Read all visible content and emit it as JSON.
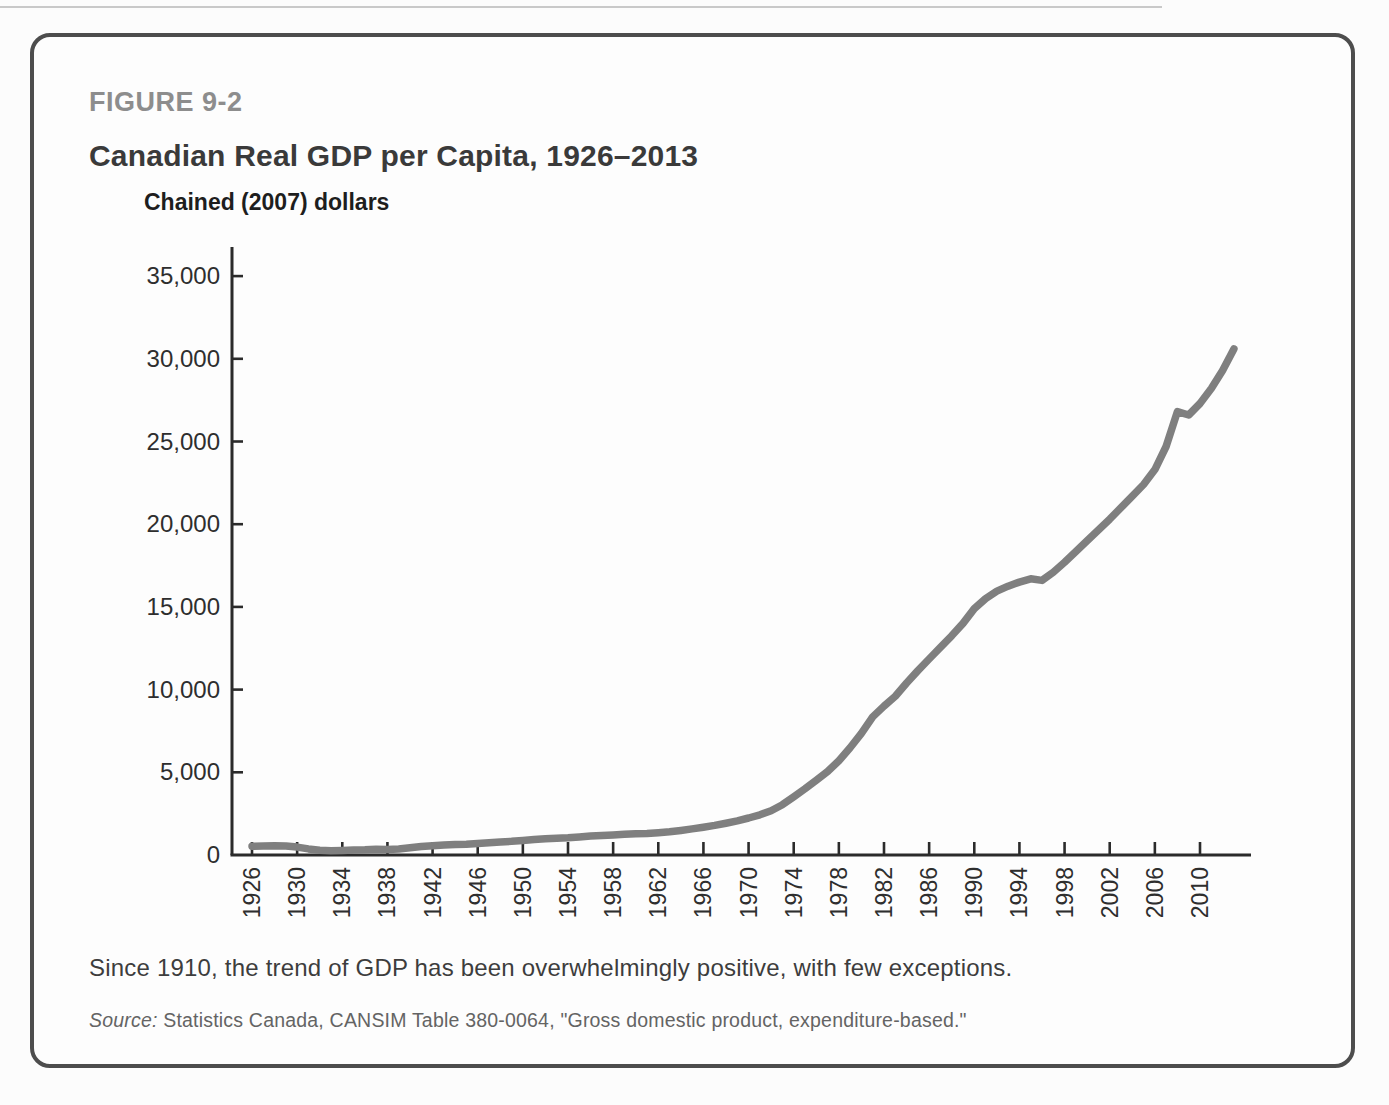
{
  "figure": {
    "label": "FIGURE 9-2",
    "title": "Canadian Real GDP per Capita, 1926–2013",
    "caption": "Since 1910, the trend of GDP has been overwhelmingly positive, with few exceptions.",
    "source_prefix": "Source:",
    "source_text": " Statistics Canada, CANSIM Table 380-0064, \"Gross domestic product, expenditure-based.\""
  },
  "colors": {
    "line": "#7f7f7f",
    "axis": "#2b2b2b",
    "card_border": "#4d4d4d",
    "figure_label": "#8d8d8d",
    "title_text": "#3a3a3a"
  },
  "chart_data": {
    "type": "line",
    "title": "Canadian Real GDP per Capita, 1926–2013",
    "ylabel": "Chained (2007) dollars",
    "xlabel": "",
    "grid": false,
    "legend": "none",
    "ylim": [
      0,
      36500
    ],
    "xlim": [
      1926,
      2014
    ],
    "x_start": 1926,
    "y_ticks": [
      0,
      5000,
      10000,
      15000,
      20000,
      25000,
      30000,
      35000
    ],
    "y_tick_labels": [
      "0",
      "5,000",
      "10,000",
      "15,000",
      "20,000",
      "25,000",
      "30,000",
      "35,000"
    ],
    "x_ticks": [
      1926,
      1930,
      1934,
      1938,
      1942,
      1946,
      1950,
      1954,
      1958,
      1962,
      1966,
      1970,
      1974,
      1978,
      1982,
      1986,
      1990,
      1994,
      1998,
      2002,
      2006,
      2010
    ],
    "x_tick_labels": [
      "1926",
      "1930",
      "1934",
      "1938",
      "1942",
      "1946",
      "1950",
      "1954",
      "1958",
      "1962",
      "1966",
      "1970",
      "1974",
      "1978",
      "1982",
      "1986",
      "1990",
      "1994",
      "1998",
      "2002",
      "2006",
      "2010"
    ],
    "series": [
      {
        "name": "Canadian real GDP per capita (chained 2007 dollars)",
        "x": [
          1926,
          1927,
          1928,
          1929,
          1930,
          1931,
          1932,
          1933,
          1934,
          1935,
          1936,
          1937,
          1938,
          1939,
          1940,
          1941,
          1942,
          1943,
          1944,
          1945,
          1946,
          1947,
          1948,
          1949,
          1950,
          1951,
          1952,
          1953,
          1954,
          1955,
          1956,
          1957,
          1958,
          1959,
          1960,
          1961,
          1962,
          1963,
          1964,
          1965,
          1966,
          1967,
          1968,
          1969,
          1970,
          1971,
          1972,
          1973,
          1974,
          1975,
          1976,
          1977,
          1978,
          1979,
          1980,
          1981,
          1982,
          1983,
          1984,
          1985,
          1986,
          1987,
          1988,
          1989,
          1990,
          1991,
          1992,
          1993,
          1994,
          1995,
          1996,
          1997,
          1998,
          1999,
          2000,
          2001,
          2002,
          2003,
          2004,
          2005,
          2006,
          2007,
          2008,
          2009,
          2010,
          2011,
          2012,
          2013
        ],
        "values": [
          530,
          545,
          560,
          545,
          480,
          370,
          290,
          255,
          280,
          300,
          315,
          345,
          340,
          365,
          435,
          505,
          560,
          600,
          630,
          650,
          700,
          745,
          795,
          830,
          880,
          940,
          980,
          1010,
          1040,
          1090,
          1150,
          1180,
          1210,
          1250,
          1280,
          1300,
          1350,
          1410,
          1490,
          1580,
          1680,
          1790,
          1920,
          2070,
          2240,
          2430,
          2680,
          3040,
          3510,
          4000,
          4520,
          5050,
          5700,
          6480,
          7350,
          8350,
          9000,
          9600,
          10400,
          11150,
          11850,
          12550,
          13250,
          14000,
          14900,
          15500,
          15950,
          16250,
          16500,
          16700,
          16600,
          17100,
          17700,
          18350,
          19000,
          19650,
          20300,
          21000,
          21700,
          22400,
          23300,
          24700,
          26800,
          26600,
          27300,
          28200,
          29300,
          30600
        ]
      }
    ]
  }
}
